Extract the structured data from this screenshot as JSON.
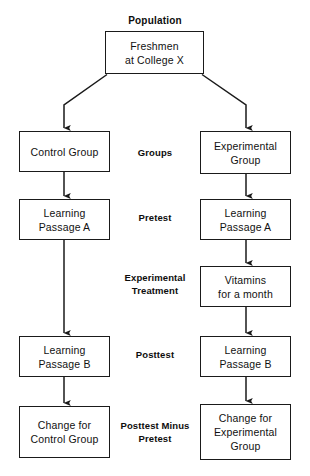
{
  "diagram": {
    "title": "Population",
    "nodes": {
      "population": {
        "lines": [
          "Freshmen",
          "at College X"
        ]
      },
      "control_group": {
        "lines": [
          "Control  Group"
        ]
      },
      "experimental_group": {
        "lines": [
          "Experimental",
          "Group"
        ]
      },
      "control_pretest": {
        "lines": [
          "Learning",
          "Passage A"
        ]
      },
      "experimental_pretest": {
        "lines": [
          "Learning",
          "Passage A"
        ]
      },
      "treatment": {
        "lines": [
          "Vitamins",
          "for a month"
        ]
      },
      "control_posttest": {
        "lines": [
          "Learning",
          "Passage B"
        ]
      },
      "experimental_posttest": {
        "lines": [
          "Learning",
          "Passage B"
        ]
      },
      "control_change": {
        "lines": [
          "Change for",
          "Control Group"
        ]
      },
      "experimental_change": {
        "lines": [
          "Change for",
          "Experimental",
          "Group"
        ]
      }
    },
    "stage_labels": {
      "groups": {
        "lines": [
          "Groups"
        ]
      },
      "pretest": {
        "lines": [
          "Pretest"
        ]
      },
      "treatment": {
        "lines": [
          "Experimental",
          "Treatment"
        ]
      },
      "posttest": {
        "lines": [
          "Posttest"
        ]
      },
      "change": {
        "lines": [
          "Posttest Minus",
          "Pretest"
        ]
      }
    },
    "colors": {
      "box_border": "#1a1a1a",
      "text": "#111111",
      "background": "#ffffff",
      "connector": "#1a1a1a"
    }
  }
}
